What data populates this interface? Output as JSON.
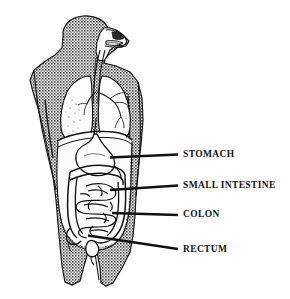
{
  "figure": {
    "background_color": "#ffffff",
    "ink_color": "#121212",
    "body_fill_color": "#8e8e8e",
    "organ_fill_color": "#fbfbfb"
  },
  "callouts": [
    {
      "id": "stomach",
      "label": "STOMACH",
      "label_x": 183,
      "label_y": 150,
      "leader": {
        "x1": 110,
        "y1": 157.5,
        "x2": 178,
        "y2": 154.5
      }
    },
    {
      "id": "small-intestine",
      "label": "SMALL INTESTINE",
      "label_x": 183,
      "label_y": 181,
      "leader": {
        "x1": 110,
        "y1": 190,
        "x2": 178,
        "y2": 185.5
      }
    },
    {
      "id": "colon",
      "label": "COLON",
      "label_x": 183,
      "label_y": 210,
      "leader": {
        "x1": 112,
        "y1": 213,
        "x2": 178,
        "y2": 215
      }
    },
    {
      "id": "rectum",
      "label": "RECTUM",
      "label_x": 183,
      "label_y": 245,
      "leader": {
        "x1": 88,
        "y1": 235.5,
        "x2": 178,
        "y2": 249
      }
    }
  ],
  "anatomy_parts": [
    {
      "id": "head-profile",
      "name": "Head in profile"
    },
    {
      "id": "nasal-cavity",
      "name": "Nasal cavity"
    },
    {
      "id": "mouth-tongue",
      "name": "Mouth and tongue"
    },
    {
      "id": "esophagus",
      "name": "Esophagus"
    },
    {
      "id": "trachea",
      "name": "Trachea"
    },
    {
      "id": "lung-left",
      "name": "Left lung"
    },
    {
      "id": "lung-right",
      "name": "Right lung"
    },
    {
      "id": "bronchial-tree",
      "name": "Bronchial tree"
    },
    {
      "id": "diaphragm",
      "name": "Diaphragm"
    },
    {
      "id": "stomach",
      "name": "Stomach"
    },
    {
      "id": "small-intestine",
      "name": "Small intestine"
    },
    {
      "id": "colon",
      "name": "Colon"
    },
    {
      "id": "rectum",
      "name": "Rectum"
    },
    {
      "id": "torso",
      "name": "Torso silhouette"
    },
    {
      "id": "arm-left",
      "name": "Left arm"
    },
    {
      "id": "arm-right",
      "name": "Right arm"
    },
    {
      "id": "leg-left",
      "name": "Left leg"
    },
    {
      "id": "leg-right",
      "name": "Right leg"
    }
  ]
}
